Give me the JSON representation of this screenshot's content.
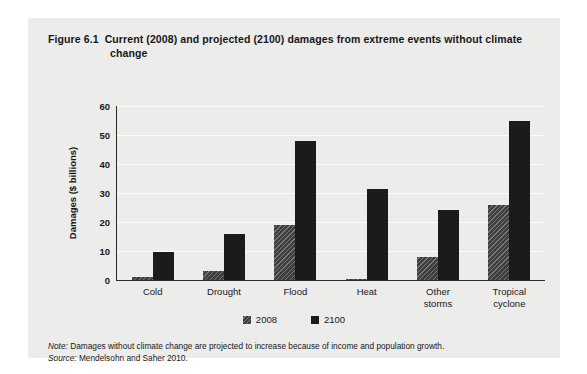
{
  "figure": {
    "number": "Figure 6.1",
    "title": "Current (2008) and projected (2100) damages from extreme events without climate change"
  },
  "notes": {
    "note_label": "Note:",
    "note_text": "Damages without climate change are projected to increase because of income and population growth.",
    "source_label": "Source:",
    "source_text": "Mendelsohn and Saher 2010."
  },
  "legend": {
    "items": [
      {
        "label": "2008",
        "color": "#3e3e40",
        "pattern": "diagonal-hatch"
      },
      {
        "label": "2100",
        "color": "#1b1b1d",
        "pattern": "solid"
      }
    ]
  },
  "chart_data": {
    "type": "bar",
    "title": "Current (2008) and projected (2100) damages from extreme events without climate change",
    "xlabel": "",
    "ylabel": "Damages ($ billions)",
    "ylim": [
      0,
      60
    ],
    "yticks": [
      0,
      10,
      20,
      30,
      40,
      50,
      60
    ],
    "grid": true,
    "legend_position": "bottom",
    "categories": [
      "Cold",
      "Drought",
      "Flood",
      "Heat",
      "Other storms",
      "Tropical cyclone"
    ],
    "category_lines": [
      [
        "Cold"
      ],
      [
        "Drought"
      ],
      [
        "Flood"
      ],
      [
        "Heat"
      ],
      [
        "Other",
        "storms"
      ],
      [
        "Tropical",
        "cyclone"
      ]
    ],
    "series": [
      {
        "name": "2008",
        "color": "#3e3e40",
        "values": [
          1,
          3,
          19,
          0.5,
          8,
          26
        ]
      },
      {
        "name": "2100",
        "color": "#1b1b1d",
        "values": [
          9.5,
          16,
          48,
          31.5,
          24,
          55
        ]
      }
    ]
  }
}
